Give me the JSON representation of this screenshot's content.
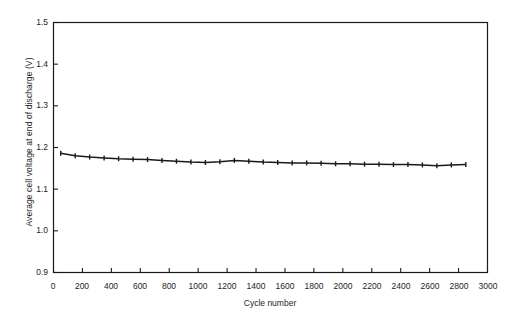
{
  "chart_data": {
    "type": "line",
    "title": "",
    "xlabel": "Cycle number",
    "ylabel": "Average cell voltage at end of discharge (V)",
    "xlim": [
      0,
      3000
    ],
    "ylim": [
      0.9,
      1.5
    ],
    "xticks": [
      0,
      200,
      400,
      600,
      800,
      1000,
      1200,
      1400,
      1600,
      1800,
      2000,
      2200,
      2400,
      2600,
      2800,
      3000
    ],
    "yticks": [
      0.9,
      1.0,
      1.1,
      1.2,
      1.3,
      1.4,
      1.5
    ],
    "xtick_labels": [
      "0",
      "200",
      "400",
      "600",
      "800",
      "1000",
      "1200",
      "1400",
      "1600",
      "1800",
      "2000",
      "2200",
      "2400",
      "2600",
      "2800",
      "3000"
    ],
    "ytick_labels": [
      "0.9",
      "1.0",
      "1.1",
      "1.2",
      "1.3",
      "1.4",
      "1.5"
    ],
    "grid": false,
    "legend": null,
    "series": [
      {
        "name": "Average cell voltage at end of discharge",
        "color": "#1a1a1a",
        "marker": "errorbar",
        "x": [
          50,
          150,
          250,
          350,
          450,
          550,
          650,
          750,
          850,
          950,
          1050,
          1150,
          1250,
          1350,
          1450,
          1550,
          1650,
          1750,
          1850,
          1950,
          2050,
          2150,
          2250,
          2350,
          2450,
          2550,
          2650,
          2750,
          2850
        ],
        "values": [
          1.186,
          1.18,
          1.177,
          1.175,
          1.173,
          1.172,
          1.171,
          1.169,
          1.167,
          1.165,
          1.164,
          1.166,
          1.169,
          1.167,
          1.165,
          1.164,
          1.163,
          1.163,
          1.162,
          1.161,
          1.161,
          1.16,
          1.16,
          1.159,
          1.159,
          1.158,
          1.156,
          1.158,
          1.159
        ],
        "yerr": [
          0.006,
          0.006,
          0.006,
          0.006,
          0.006,
          0.006,
          0.006,
          0.006,
          0.006,
          0.006,
          0.006,
          0.006,
          0.006,
          0.006,
          0.006,
          0.006,
          0.006,
          0.006,
          0.006,
          0.006,
          0.006,
          0.006,
          0.006,
          0.006,
          0.006,
          0.006,
          0.006,
          0.006,
          0.006
        ]
      }
    ]
  }
}
